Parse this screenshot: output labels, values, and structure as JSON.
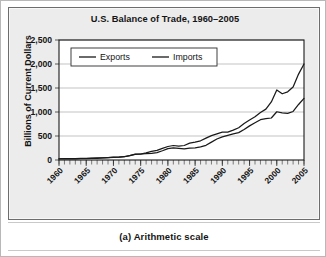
{
  "figure": {
    "caption": "(a) Arithmetic scale"
  },
  "chart_data": {
    "type": "line",
    "title": "U.S. Balance of Trade, 1960–2005",
    "xlabel": "",
    "ylabel": "Billions of Current Dollars",
    "xlim": [
      1960,
      2005
    ],
    "ylim": [
      0,
      2500
    ],
    "yticks": [
      0,
      500,
      1000,
      1500,
      2000,
      2500
    ],
    "ytick_labels": [
      "0",
      "500",
      "1,000",
      "1,500",
      "2,000",
      "2,500"
    ],
    "xticks": [
      1960,
      1965,
      1970,
      1975,
      1980,
      1985,
      1990,
      1995,
      2000,
      2005
    ],
    "xtick_labels": [
      "1960",
      "1965",
      "1970",
      "1975",
      "1980",
      "1985",
      "1990",
      "1995",
      "2000",
      "2005"
    ],
    "minor_xtick_step": 1,
    "grid": "horizontal",
    "legend_position": "top-left-inside",
    "x": [
      1960,
      1961,
      1962,
      1963,
      1964,
      1965,
      1966,
      1967,
      1968,
      1969,
      1970,
      1971,
      1972,
      1973,
      1974,
      1975,
      1976,
      1977,
      1978,
      1979,
      1980,
      1981,
      1982,
      1983,
      1984,
      1985,
      1986,
      1987,
      1988,
      1989,
      1990,
      1991,
      1992,
      1993,
      1994,
      1995,
      1996,
      1997,
      1998,
      1999,
      2000,
      2001,
      2002,
      2003,
      2004,
      2005
    ],
    "series": [
      {
        "name": "Exports",
        "values": [
          26,
          27,
          28,
          30,
          34,
          36,
          39,
          42,
          46,
          51,
          58,
          61,
          68,
          90,
          116,
          125,
          132,
          136,
          153,
          192,
          238,
          253,
          241,
          230,
          248,
          255,
          272,
          306,
          372,
          437,
          481,
          515,
          545,
          570,
          634,
          711,
          775,
          840,
          860,
          875,
          1005,
          983,
          970,
          1011,
          1157,
          1283
        ]
      },
      {
        "name": "Imports",
        "values": [
          22,
          22,
          24,
          25,
          27,
          30,
          34,
          36,
          43,
          48,
          54,
          60,
          70,
          92,
          121,
          121,
          148,
          180,
          202,
          244,
          281,
          302,
          287,
          302,
          352,
          371,
          400,
          455,
          508,
          546,
          581,
          582,
          623,
          672,
          759,
          832,
          900,
          990,
          1060,
          1210,
          1460,
          1380,
          1420,
          1520,
          1790,
          2000
        ]
      }
    ]
  }
}
